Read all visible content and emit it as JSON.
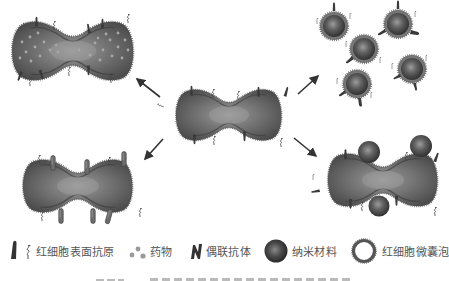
{
  "figure": {
    "center": {
      "label": "red-blood-cell"
    },
    "panels": [
      {
        "position": "top-left",
        "content": "red-blood-cell-loaded-with-drug"
      },
      {
        "position": "top-right",
        "content": "red-blood-cell-membrane-coated-nanoparticles"
      },
      {
        "position": "bottom-left",
        "content": "red-blood-cell-with-coupled-antibodies"
      },
      {
        "position": "bottom-right",
        "content": "red-blood-cell-with-surface-attached-nanomaterials"
      }
    ]
  },
  "legend": {
    "items": [
      {
        "icon": "antigen-icon",
        "label": "红细胞表面抗原"
      },
      {
        "icon": "drug-icon",
        "label": "药物"
      },
      {
        "icon": "antibody-icon",
        "label": "偶联抗体"
      },
      {
        "icon": "nanomaterial-icon",
        "label": "纳米材料"
      },
      {
        "icon": "rbc-vesicle-icon",
        "label": "红细胞微囊泡"
      }
    ]
  },
  "colors": {
    "cell_body": "#6a6a6a",
    "cell_dark": "#3f3f3f",
    "cell_light": "#9a9a9a",
    "membrane_dots": "#7a7a7a",
    "arrow": "#333333",
    "drug_dot": "#a8a8a8",
    "legend_text": "#555555"
  }
}
